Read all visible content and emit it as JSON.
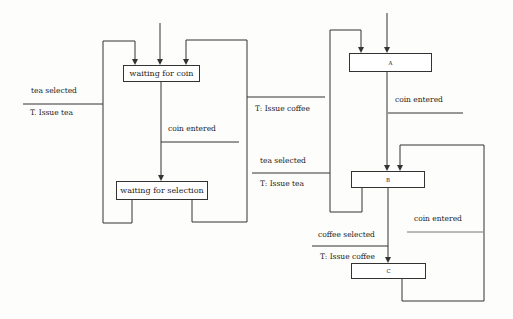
{
  "diagram_left": {
    "states": [
      {
        "id": "waiting_for_coin",
        "label": "waiting for coin"
      },
      {
        "id": "waiting_for_selection",
        "label": "waiting for selection"
      }
    ],
    "labels": {
      "tea_selected": "tea selected",
      "issue_tea": "T. Issue tea",
      "coin_entered": "coin entered",
      "issue_coffee": "T: Issue coffee"
    }
  },
  "diagram_right": {
    "states": [
      {
        "id": "A",
        "label": "A"
      },
      {
        "id": "B",
        "label": "B"
      },
      {
        "id": "C",
        "label": "C"
      }
    ],
    "labels": {
      "coin_entered_ab": "coin entered",
      "tea_selected": "tea selected",
      "issue_tea": "T: Issue tea",
      "coin_entered_cb": "coin entered",
      "coffee_selected": "coffee selected",
      "issue_coffee": "T: Issue coffee"
    }
  },
  "colors": {
    "line": "#333333",
    "background": "#fdfdfc"
  }
}
